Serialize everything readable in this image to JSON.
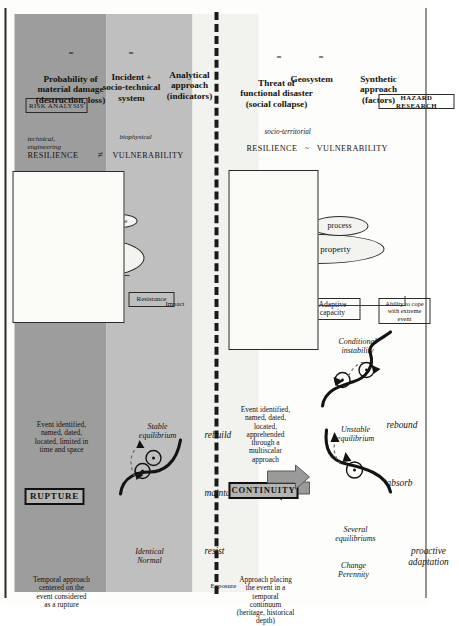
{
  "figure": {
    "colors": {
      "band_dark": "#9d9d9d",
      "band_mid": "#bfbfbf",
      "band_light": "#f2f2ef",
      "arrow_fill": "#9a9a9a",
      "ink": "#15130f"
    }
  },
  "top_half": {
    "name": "risk-analysis-track",
    "header_box": {
      "label": "RISK ANALYSIS"
    },
    "equation": [
      "Probability of material damage (destruction, loss)",
      "=",
      "Incident + socio-technical system",
      "=",
      "Analytical approach (indicators)"
    ],
    "equation_lines": {
      "l1": "Probability of",
      "l2": "material damage",
      "l3": "(destruction, loss)",
      "eq1": "=",
      "l4": "Incident +",
      "l5": "socio-technical",
      "l6": "system",
      "eq2": "=",
      "l7": "Analytical",
      "l8": "approach",
      "l9": "(indicators)"
    },
    "axis_labels": {
      "impact": "Impact",
      "exposure": "Exposure"
    },
    "sub_boxes": [
      {
        "label": "Resistance"
      },
      {
        "label": "Protection"
      }
    ],
    "center_ellipse": {
      "l1": "Damage",
      "l2": "Value"
    },
    "state_ellipse": {
      "label": "State"
    },
    "relation_frame": {
      "left_term": "RESILIENCE",
      "left_sub_l1": "technical,",
      "left_sub_l2": "engineering",
      "operator": "≠",
      "right_term": "VULNERABILITY",
      "right_sub": "biophysical"
    },
    "verbs": [
      "resist",
      "maintain",
      "rebuild"
    ],
    "mid_band": {
      "state_l1": "Identical",
      "state_l2": "Normal",
      "equilibrium_l1": "Stable",
      "equilibrium_l2": "equilibrium"
    },
    "dark_band": {
      "approach_l1": "Temporal approach",
      "approach_l2": "centered on the",
      "approach_l3": "event considered",
      "approach_l4": "as a rupture",
      "keyword": "RUPTURE",
      "event_l1": "Event identified,",
      "event_l2": "named, dated,",
      "event_l3": "located, limited in",
      "event_l4": "time and space"
    }
  },
  "bottom_half": {
    "name": "hazard-research-track",
    "header_box": {
      "label": "HAZARD RESEARCH"
    },
    "equation_lines": {
      "l1": "Threat of",
      "l2": "functional disaster",
      "l3": "(social collapse)",
      "eq1": "=",
      "l4": "Geosystem",
      "eq2": "=",
      "l5": "Synthetic",
      "l6": "approach",
      "l7": "(factors)"
    },
    "sub_boxes": [
      {
        "l1": "Ability to cope",
        "l2": "with extreme",
        "l3": "event"
      },
      {
        "l1": "Adaptive",
        "l2": "capacity"
      },
      {
        "l1": "Self-",
        "l2": "organization"
      }
    ],
    "center_ellipse": {
      "label": "Intrinsic property"
    },
    "process_ellipse": {
      "label": "process"
    },
    "relation_frame": {
      "left_term": "RESILIENCE",
      "operator": "~",
      "right_term": "VULNERABILITY",
      "sub": "socio-territorial"
    },
    "verbs": [
      "proactive adaptation",
      "absorb",
      "rebound"
    ],
    "verbs_lines": {
      "v1a": "proactive",
      "v1b": "adaptation",
      "v2": "absorb",
      "v3": "rebound"
    },
    "mid_band": {
      "state_l1": "Change",
      "state_l2": "Perennity",
      "equilibrium_l1": "Several",
      "equilibrium_l2": "equilibriums",
      "unstable_l1": "Unstable",
      "unstable_l2": "equilibrium",
      "conditional_l1": "Conditional",
      "conditional_l2": "instability"
    },
    "dark_band": {
      "approach_l1": "Approach placing",
      "approach_l2": "the event in a",
      "approach_l3": "temporal",
      "approach_l4": "continuum",
      "approach_l5": "(heritage, historical",
      "approach_l6": "depth)",
      "keyword": "CONTINUITY",
      "event_l1": "Event identified,",
      "event_l2": "named, dated,",
      "event_l3": "located,",
      "event_l4": "apprehended",
      "event_l5": "through a",
      "event_l6": "multiscalar",
      "event_l7": "approach"
    }
  }
}
